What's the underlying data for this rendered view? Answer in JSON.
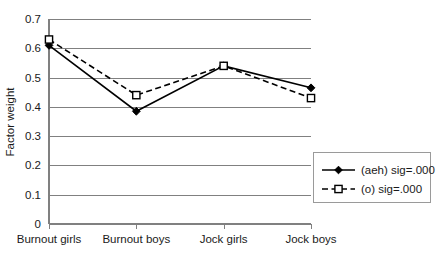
{
  "chart_data": {
    "type": "line",
    "title": "",
    "subtitle": "",
    "xlabel": "",
    "ylabel": "Factor weight",
    "categories": [
      "Burnout girls",
      "Burnout boys",
      "Jock girls",
      "Jock boys"
    ],
    "series": [
      {
        "name": "(aeh) sig=.000",
        "values": [
          0.61,
          0.385,
          0.54,
          0.465
        ],
        "line_style": "solid",
        "marker": "filled-diamond",
        "color": "#000000"
      },
      {
        "name": "(o) sig=.000",
        "values": [
          0.63,
          0.44,
          0.54,
          0.43
        ],
        "line_style": "dashed",
        "marker": "open-square",
        "color": "#000000"
      }
    ],
    "ylim": [
      0,
      0.7
    ],
    "yticks": [
      "0",
      "0.1",
      "0.2",
      "0.3",
      "0.4",
      "0.5",
      "0.6",
      "0.7"
    ],
    "ytick_values": [
      0,
      0.1,
      0.2,
      0.3,
      0.4,
      0.5,
      0.6,
      0.7
    ],
    "grid": true,
    "grid_axis": "y",
    "grid_color": "#808080",
    "legend_position": "bottom-right",
    "background_color": "#ffffff",
    "axis_color": "#808080"
  },
  "legend": {
    "entries": [
      {
        "label": "(aeh) sig=.000"
      },
      {
        "label": "(o) sig=.000"
      }
    ]
  }
}
